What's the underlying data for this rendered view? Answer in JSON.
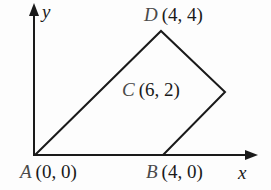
{
  "diagram": {
    "type": "coordinate-plane-quadrilateral",
    "axes": {
      "x_label": "x",
      "y_label": "y"
    },
    "vertices": [
      {
        "name": "A",
        "coords": "(0, 0)"
      },
      {
        "name": "B",
        "coords": "(4, 0)"
      },
      {
        "name": "C",
        "coords": "(6, 2)"
      },
      {
        "name": "D",
        "coords": "(4, 4)"
      }
    ],
    "edges": [
      [
        "A",
        "B"
      ],
      [
        "B",
        "C"
      ],
      [
        "C",
        "D"
      ],
      [
        "D",
        "A"
      ]
    ],
    "colors": {
      "line": "#1a1a1a",
      "background": "#fdfdfd",
      "vertex_letter": "#4a4a4a"
    }
  }
}
